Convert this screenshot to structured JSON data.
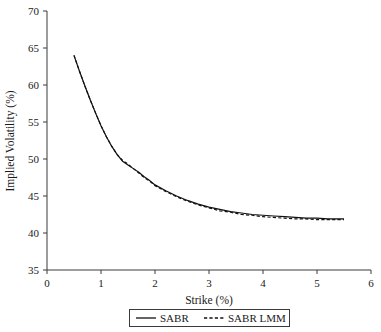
{
  "chart_data": {
    "type": "line",
    "title": "",
    "xlabel": "Strike (%)",
    "ylabel": "Implied Volatility (%)",
    "xlim": [
      0,
      6
    ],
    "ylim": [
      35,
      70
    ],
    "xticks": [
      0,
      1,
      2,
      3,
      4,
      5,
      6
    ],
    "yticks": [
      35,
      40,
      45,
      50,
      55,
      60,
      65,
      70
    ],
    "xtick_labels": [
      "0",
      "1",
      "2",
      "3",
      "4",
      "5",
      "6"
    ],
    "ytick_labels": [
      "35",
      "40",
      "45",
      "50",
      "55",
      "60",
      "65",
      "70"
    ],
    "grid": false,
    "legend_position": "below-axis-center",
    "x": [
      0.5,
      0.6,
      0.7,
      0.8,
      0.9,
      1.0,
      1.1,
      1.2,
      1.3,
      1.4,
      1.5,
      1.6,
      1.7,
      1.8,
      1.9,
      2.0,
      2.2,
      2.4,
      2.6,
      2.8,
      3.0,
      3.2,
      3.4,
      3.6,
      3.8,
      4.0,
      4.2,
      4.4,
      4.6,
      4.8,
      5.0,
      5.2,
      5.5
    ],
    "series": [
      {
        "name": "SABR",
        "style": "solid",
        "color": "#111111",
        "values": [
          64.0,
          61.9,
          59.9,
          58.0,
          56.2,
          54.5,
          53.0,
          51.7,
          50.6,
          49.7,
          49.2,
          48.7,
          48.2,
          47.6,
          47.1,
          46.5,
          45.7,
          45.0,
          44.4,
          43.9,
          43.5,
          43.2,
          42.9,
          42.7,
          42.5,
          42.4,
          42.3,
          42.2,
          42.1,
          42.0,
          42.0,
          41.9,
          41.9
        ]
      },
      {
        "name": "SABR LMM",
        "style": "dashed",
        "color": "#111111",
        "values": [
          64.0,
          61.9,
          59.9,
          58.0,
          56.2,
          54.5,
          53.0,
          51.7,
          50.6,
          49.8,
          49.3,
          48.7,
          48.1,
          47.5,
          47.0,
          46.4,
          45.6,
          44.9,
          44.3,
          43.8,
          43.4,
          43.0,
          42.8,
          42.5,
          42.4,
          42.2,
          42.1,
          42.0,
          41.9,
          41.9,
          41.8,
          41.8,
          41.8
        ]
      }
    ],
    "legend": [
      {
        "label": "SABR",
        "style": "solid"
      },
      {
        "label": "SABR LMM",
        "style": "dashed"
      }
    ]
  }
}
